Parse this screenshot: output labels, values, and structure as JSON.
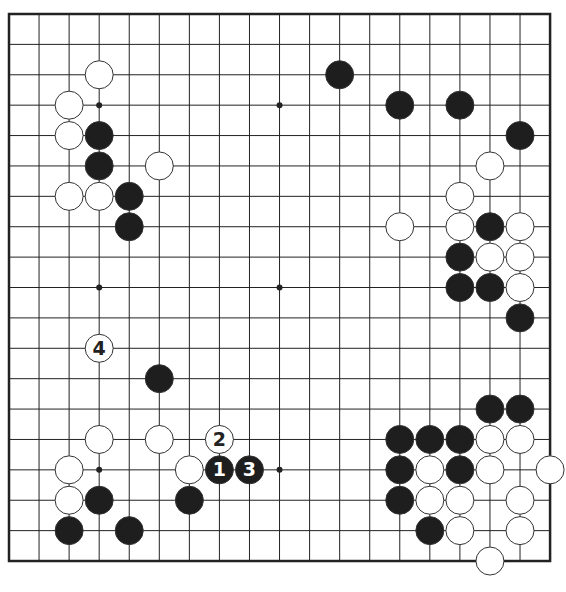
{
  "diagram": {
    "type": "go-board",
    "size": 19,
    "origin": {
      "x": 9,
      "y": 14
    },
    "spacing": {
      "x": 30.06,
      "y": 30.39
    },
    "stone_radius": 14,
    "colors": {
      "line": "#222222",
      "border": "#222222",
      "black_stone": "#1e1e1e",
      "white_stone": "#ffffff",
      "stone_outline": "#333333",
      "label_on_black": "#ffffff",
      "label_on_white": "#222222"
    },
    "star_points": [
      [
        3,
        3
      ],
      [
        9,
        3
      ],
      [
        15,
        3
      ],
      [
        3,
        9
      ],
      [
        9,
        9
      ],
      [
        15,
        9
      ],
      [
        3,
        15
      ],
      [
        9,
        15
      ],
      [
        15,
        15
      ]
    ],
    "stones": [
      {
        "color": "white",
        "col": 3,
        "row": 2
      },
      {
        "color": "white",
        "col": 2,
        "row": 3
      },
      {
        "color": "white",
        "col": 2,
        "row": 4
      },
      {
        "color": "black",
        "col": 3,
        "row": 4
      },
      {
        "color": "black",
        "col": 3,
        "row": 5
      },
      {
        "color": "white",
        "col": 5,
        "row": 5
      },
      {
        "color": "white",
        "col": 2,
        "row": 6
      },
      {
        "color": "white",
        "col": 3,
        "row": 6
      },
      {
        "color": "black",
        "col": 4,
        "row": 6
      },
      {
        "color": "black",
        "col": 4,
        "row": 7
      },
      {
        "color": "black",
        "col": 11,
        "row": 2
      },
      {
        "color": "black",
        "col": 13,
        "row": 3
      },
      {
        "color": "black",
        "col": 15,
        "row": 3
      },
      {
        "color": "black",
        "col": 17,
        "row": 4
      },
      {
        "color": "white",
        "col": 16,
        "row": 5
      },
      {
        "color": "white",
        "col": 15,
        "row": 6
      },
      {
        "color": "white",
        "col": 13,
        "row": 7
      },
      {
        "color": "white",
        "col": 15,
        "row": 7
      },
      {
        "color": "black",
        "col": 16,
        "row": 7
      },
      {
        "color": "white",
        "col": 17,
        "row": 7
      },
      {
        "color": "black",
        "col": 15,
        "row": 8
      },
      {
        "color": "white",
        "col": 16,
        "row": 8
      },
      {
        "color": "white",
        "col": 17,
        "row": 8
      },
      {
        "color": "black",
        "col": 15,
        "row": 9
      },
      {
        "color": "black",
        "col": 16,
        "row": 9
      },
      {
        "color": "white",
        "col": 17,
        "row": 9
      },
      {
        "color": "black",
        "col": 17,
        "row": 10
      },
      {
        "color": "white",
        "col": 3,
        "row": 11,
        "label": "4"
      },
      {
        "color": "black",
        "col": 5,
        "row": 12
      },
      {
        "color": "white",
        "col": 3,
        "row": 14
      },
      {
        "color": "white",
        "col": 5,
        "row": 14
      },
      {
        "color": "white",
        "col": 7,
        "row": 14,
        "label": "2"
      },
      {
        "color": "white",
        "col": 2,
        "row": 15
      },
      {
        "color": "white",
        "col": 6,
        "row": 15
      },
      {
        "color": "black",
        "col": 7,
        "row": 15,
        "label": "1"
      },
      {
        "color": "black",
        "col": 8,
        "row": 15,
        "label": "3"
      },
      {
        "color": "white",
        "col": 2,
        "row": 16
      },
      {
        "color": "black",
        "col": 3,
        "row": 16
      },
      {
        "color": "black",
        "col": 6,
        "row": 16
      },
      {
        "color": "black",
        "col": 2,
        "row": 17
      },
      {
        "color": "black",
        "col": 4,
        "row": 17
      },
      {
        "color": "black",
        "col": 16,
        "row": 13
      },
      {
        "color": "black",
        "col": 17,
        "row": 13
      },
      {
        "color": "black",
        "col": 13,
        "row": 14
      },
      {
        "color": "black",
        "col": 14,
        "row": 14
      },
      {
        "color": "black",
        "col": 15,
        "row": 14
      },
      {
        "color": "white",
        "col": 16,
        "row": 14
      },
      {
        "color": "white",
        "col": 17,
        "row": 14
      },
      {
        "color": "black",
        "col": 13,
        "row": 15
      },
      {
        "color": "white",
        "col": 14,
        "row": 15
      },
      {
        "color": "black",
        "col": 15,
        "row": 15
      },
      {
        "color": "white",
        "col": 16,
        "row": 15
      },
      {
        "color": "white",
        "col": 18,
        "row": 15
      },
      {
        "color": "black",
        "col": 13,
        "row": 16
      },
      {
        "color": "white",
        "col": 14,
        "row": 16
      },
      {
        "color": "white",
        "col": 15,
        "row": 16
      },
      {
        "color": "white",
        "col": 17,
        "row": 16
      },
      {
        "color": "black",
        "col": 14,
        "row": 17
      },
      {
        "color": "white",
        "col": 15,
        "row": 17
      },
      {
        "color": "white",
        "col": 17,
        "row": 17
      },
      {
        "color": "white",
        "col": 16,
        "row": 18
      }
    ]
  }
}
